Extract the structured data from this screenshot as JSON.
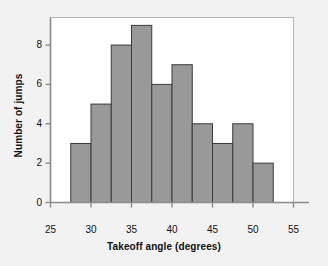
{
  "chart_data": {
    "type": "bar",
    "title": "",
    "xlabel": "Takeoff angle (degrees)",
    "ylabel": "Number of jumps",
    "categories": [
      "27.5-30",
      "30-32.5",
      "32.5-35",
      "35-37.5",
      "37.5-40",
      "40-42.5",
      "42.5-45",
      "45-47.5",
      "47.5-50",
      "50-52.5"
    ],
    "bin_edges": [
      27.5,
      30,
      32.5,
      35,
      37.5,
      40,
      42.5,
      45,
      47.5,
      50,
      52.5
    ],
    "values": [
      3,
      5,
      8,
      9,
      6,
      7,
      4,
      3,
      4,
      2
    ],
    "total_count": 51,
    "xlim": [
      25,
      55
    ],
    "ylim": [
      0,
      9.4
    ],
    "xticks": [
      25,
      30,
      35,
      40,
      45,
      50,
      55
    ],
    "yticks": [
      0,
      2,
      4,
      6,
      8
    ],
    "xtick_labels": [
      "25",
      "30",
      "35",
      "40",
      "45",
      "50",
      "55"
    ],
    "ytick_labels": [
      "0",
      "2",
      "4",
      "6",
      "8"
    ],
    "grid": false,
    "legend": false,
    "bar_fill_color": "#999999",
    "bar_edge_color": "#3a3a3a",
    "plot_background": "#ffffff",
    "figure_background": "#f2f2f2",
    "axis_color": "#7a7a7a",
    "text_color": "#111111"
  }
}
